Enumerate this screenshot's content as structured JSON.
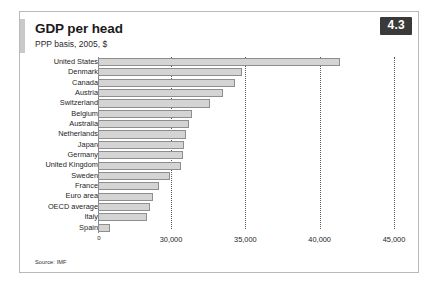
{
  "figure": {
    "badge": "4.3",
    "title": "GDP per head",
    "subtitle": "PPP basis, 2005, $",
    "source": "Source: IMF"
  },
  "chart_data": {
    "type": "bar",
    "orientation": "horizontal",
    "title": "GDP per head",
    "subtitle": "PPP basis, 2005, $",
    "xlabel": "",
    "ylabel": "",
    "unit": "$ (PPP basis, 2005)",
    "axis_note": "x-axis is broken: origin tick labelled 0, then linear from 30,000 to 45,000",
    "xlim": [
      30000,
      45000
    ],
    "ticks": [
      {
        "label": "0",
        "value": 0
      },
      {
        "label": "30,000",
        "value": 30000
      },
      {
        "label": "35,000",
        "value": 35000
      },
      {
        "label": "40,000",
        "value": 40000
      },
      {
        "label": "45,000",
        "value": 45000
      }
    ],
    "gridlines": [
      30000,
      35000,
      40000,
      45000
    ],
    "grid": true,
    "legend": null,
    "categories": [
      "United States",
      "Denmark",
      "Canada",
      "Austria",
      "Switzerland",
      "Belgium",
      "Australia",
      "Netherlands",
      "Japan",
      "Germany",
      "United Kingdom",
      "Sweden",
      "France",
      "Euro area",
      "OECD average",
      "Italy",
      "Spain"
    ],
    "values": [
      41400,
      34800,
      34300,
      33500,
      32600,
      31400,
      31200,
      31000,
      30900,
      30800,
      30700,
      29900,
      29200,
      28800,
      28600,
      28400,
      25900
    ],
    "series": [
      {
        "name": "GDP per head",
        "values": [
          41400,
          34800,
          34300,
          33500,
          32600,
          31400,
          31200,
          31000,
          30900,
          30800,
          30700,
          29900,
          29200,
          28800,
          28600,
          28400,
          25900
        ]
      }
    ],
    "colors": {
      "bar_fill": "#d4d4d4",
      "bar_border": "#8e8e8e",
      "badge_bg": "#3a3a3a",
      "badge_text": "#ffffff",
      "grid": "#5a5a5a",
      "frame": "#b9b9b9"
    }
  }
}
